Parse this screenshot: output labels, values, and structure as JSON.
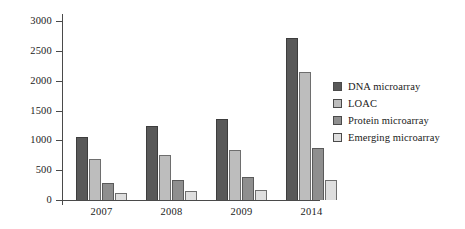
{
  "chart_data": {
    "type": "bar",
    "title": "",
    "subtitle": "",
    "xlabel": "",
    "ylabel": "",
    "categories": [
      "2007",
      "2008",
      "2009",
      "2014"
    ],
    "series": [
      {
        "name": "DNA microarray",
        "color": "#595959",
        "values": [
          1060,
          1235,
          1360,
          2720
        ]
      },
      {
        "name": "LOAC",
        "color": "#bdbdbd",
        "values": [
          690,
          760,
          830,
          2150
        ]
      },
      {
        "name": "Protein microarray",
        "color": "#8f8f8f",
        "values": [
          280,
          330,
          380,
          880
        ]
      },
      {
        "name": "Emerging microarray",
        "color": "#dedede",
        "values": [
          125,
          150,
          170,
          340
        ]
      }
    ],
    "ylim": [
      0,
      3000
    ],
    "yticks": [
      0,
      500,
      1000,
      1500,
      2000,
      2500,
      3000
    ],
    "ytick_labels": [
      "0",
      "500",
      "1000",
      "1500",
      "2000",
      "2500",
      "3000"
    ],
    "grid": false,
    "legend_position": "right"
  },
  "axes": {
    "y_ticks": [
      {
        "value": 3000,
        "label": "3000"
      },
      {
        "value": 2500,
        "label": "2500"
      },
      {
        "value": 2000,
        "label": "2000"
      },
      {
        "value": 1500,
        "label": "1500"
      },
      {
        "value": 1000,
        "label": "1000"
      },
      {
        "value": 500,
        "label": "500"
      },
      {
        "value": 0,
        "label": "0"
      }
    ],
    "x_labels": [
      "2007",
      "2008",
      "2009",
      "2014"
    ]
  },
  "legend": {
    "items": [
      {
        "label": "DNA microarray",
        "color": "#595959"
      },
      {
        "label": "LOAC",
        "color": "#bdbdbd"
      },
      {
        "label": "Protein microarray",
        "color": "#8f8f8f"
      },
      {
        "label": "Emerging microarray",
        "color": "#dedede"
      }
    ]
  }
}
